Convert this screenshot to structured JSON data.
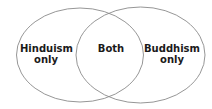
{
  "diagram": {
    "type": "venn",
    "sets": [
      {
        "name": "Hinduism",
        "region_label": "Hinduism\nonly"
      },
      {
        "name": "Buddhism",
        "region_label": "Buddhism\nonly"
      }
    ],
    "intersection_label": "Both",
    "stroke_color": "#8a8a8a",
    "text_color": "#1a1a1a"
  }
}
